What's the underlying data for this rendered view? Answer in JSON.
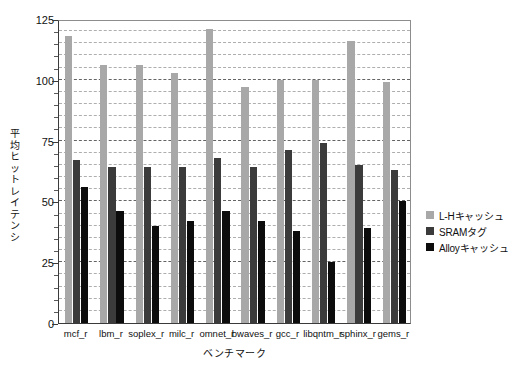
{
  "chart_data": {
    "type": "bar",
    "title": "",
    "xlabel": "ベンチマーク",
    "ylabel": "平均ヒットレイテンシ",
    "ylim": [
      0,
      125
    ],
    "yticks": [
      0,
      25,
      50,
      75,
      100,
      125
    ],
    "ytick_labels": [
      "0",
      "25",
      "50",
      "75",
      "100",
      "125"
    ],
    "grid": true,
    "grid_style": "dashed horizontal, major every 25 and minor every 5",
    "legend_position": "right",
    "categories": [
      "mcf_r",
      "lbm_r",
      "soplex_r",
      "milc_r",
      "omnet_r",
      "bwaves_r",
      "gcc_r",
      "libqntm_r",
      "sphinx_r",
      "gems_r"
    ],
    "series": [
      {
        "name": "L-Hキャッシュ",
        "color": "#a8a8a8",
        "values": [
          118,
          106,
          106,
          103,
          121,
          97,
          100,
          100,
          116,
          99
        ]
      },
      {
        "name": "SRAMタグ",
        "color": "#3b3b3b",
        "values": [
          67,
          64,
          64,
          64,
          68,
          64,
          71,
          74,
          65,
          63
        ]
      },
      {
        "name": "Alloyキャッシュ",
        "color": "#0c0c0c",
        "values": [
          56,
          46,
          40,
          42,
          46,
          42,
          38,
          25,
          39,
          50
        ]
      }
    ]
  },
  "legend": {
    "items": [
      {
        "label": "L-Hキャッシュ",
        "swatch": "legend-swatch-light-gray"
      },
      {
        "label": "SRAMタグ",
        "swatch": "legend-swatch-dark-gray"
      },
      {
        "label": "Alloyキャッシュ",
        "swatch": "legend-swatch-black"
      }
    ]
  },
  "axes": {
    "y_title": "平均ヒットレイテンシ",
    "x_title": "ベンチマーク"
  }
}
